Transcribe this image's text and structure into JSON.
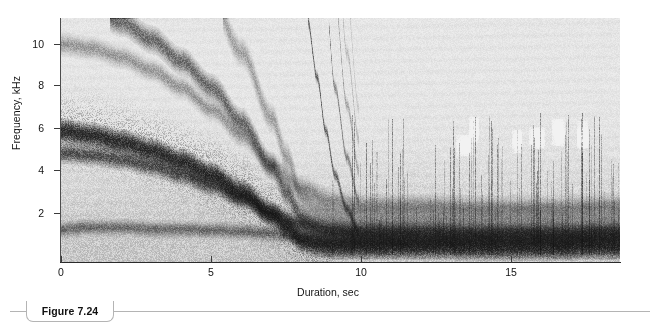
{
  "figure": {
    "caption_label": "Figure 7.24"
  },
  "chart_data": {
    "type": "heatmap",
    "title": "",
    "subtitle": "",
    "xlabel": "Duration, sec",
    "ylabel": "Frequency, kHz",
    "xlim": [
      0,
      18.6
    ],
    "ylim": [
      0,
      11.2
    ],
    "xticks": [
      0,
      5,
      10,
      15
    ],
    "xtick_labels": [
      "0",
      "5",
      "10",
      "15"
    ],
    "yticks": [
      2,
      4,
      6,
      8,
      10
    ],
    "ytick_labels": [
      "2",
      "4",
      "6",
      "8",
      "10"
    ],
    "grid": false,
    "legend": "none",
    "colormap": "grayscale",
    "colormap_low": "#f2f2f0",
    "colormap_high": "#111111",
    "series": [
      {
        "name": "descending-fundamental",
        "x": [
          0,
          1,
          2,
          3,
          4,
          5,
          6,
          7,
          7.5,
          8,
          8.5,
          9,
          10,
          12,
          14,
          16,
          18.6
        ],
        "values": [
          6.0,
          5.8,
          5.5,
          5.1,
          4.6,
          4.0,
          3.2,
          2.2,
          1.6,
          1.0,
          0.8,
          0.72,
          0.7,
          0.7,
          0.68,
          0.68,
          0.7
        ]
      },
      {
        "name": "second-band",
        "x": [
          0,
          1,
          2,
          3,
          4,
          5,
          6,
          7,
          8,
          9,
          10,
          12,
          14,
          16,
          18.6
        ],
        "values": [
          5.0,
          4.9,
          4.7,
          4.4,
          4.0,
          3.5,
          2.9,
          2.2,
          1.7,
          1.4,
          1.3,
          1.3,
          1.25,
          1.25,
          1.3
        ]
      },
      {
        "name": "low-band",
        "x": [
          0,
          1,
          2,
          3,
          4,
          5,
          6,
          7,
          8,
          9,
          10,
          12,
          14,
          16,
          18.6
        ],
        "values": [
          1.5,
          1.6,
          1.6,
          1.5,
          1.5,
          1.45,
          1.4,
          1.3,
          1.1,
          0.95,
          0.95,
          0.95,
          0.95,
          0.95,
          1.0
        ]
      },
      {
        "name": "steep-chirp-harmonics",
        "x": [
          8.2,
          8.5,
          8.8,
          9.1,
          9.5,
          9.9
        ],
        "values": [
          11.0,
          8.5,
          6.0,
          4.0,
          2.4,
          1.4
        ]
      }
    ]
  }
}
